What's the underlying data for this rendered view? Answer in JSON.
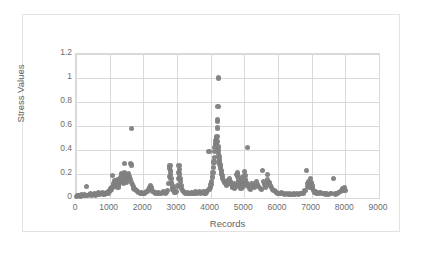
{
  "chart_data": {
    "type": "scatter",
    "title": "",
    "xlabel": "Records",
    "ylabel": "Stress Values",
    "xlim": [
      0,
      9000
    ],
    "ylim": [
      0,
      1.2
    ],
    "xticks": [
      "0",
      "1000",
      "2000",
      "3000",
      "4000",
      "5000",
      "6000",
      "7000",
      "8000",
      "9000"
    ],
    "yticks": [
      "0",
      "0.2",
      "0.4",
      "0.6",
      "0.8",
      "1",
      "1.2"
    ],
    "xtick_values": [
      0,
      1000,
      2000,
      3000,
      4000,
      5000,
      6000,
      7000,
      8000,
      9000
    ],
    "ytick_values": [
      0,
      0.2,
      0.4,
      0.6,
      0.8,
      1,
      1.2
    ],
    "grid": true,
    "legend": false,
    "marker_color": "#7f7f7f",
    "marker_size": 2.6,
    "gridline_color": "#d9d9d9",
    "series": [
      {
        "name": "Stress Values",
        "points": [
          [
            20,
            0.012
          ],
          [
            55,
            0.018
          ],
          [
            90,
            0.022
          ],
          [
            130,
            0.015
          ],
          [
            170,
            0.028
          ],
          [
            210,
            0.02
          ],
          [
            250,
            0.031
          ],
          [
            290,
            0.024
          ],
          [
            320,
            0.095
          ],
          [
            350,
            0.018
          ],
          [
            390,
            0.026
          ],
          [
            430,
            0.034
          ],
          [
            470,
            0.021
          ],
          [
            510,
            0.029
          ],
          [
            550,
            0.038
          ],
          [
            590,
            0.025
          ],
          [
            630,
            0.033
          ],
          [
            670,
            0.041
          ],
          [
            710,
            0.027
          ],
          [
            750,
            0.036
          ],
          [
            790,
            0.044
          ],
          [
            830,
            0.03
          ],
          [
            870,
            0.039
          ],
          [
            910,
            0.048
          ],
          [
            950,
            0.035
          ],
          [
            980,
            0.052
          ],
          [
            1010,
            0.062
          ],
          [
            1040,
            0.075
          ],
          [
            1070,
            0.088
          ],
          [
            1090,
            0.185
          ],
          [
            1110,
            0.105
          ],
          [
            1130,
            0.12
          ],
          [
            1150,
            0.142
          ],
          [
            1170,
            0.098
          ],
          [
            1190,
            0.115
          ],
          [
            1210,
            0.133
          ],
          [
            1230,
            0.155
          ],
          [
            1250,
            0.09
          ],
          [
            1270,
            0.108
          ],
          [
            1290,
            0.126
          ],
          [
            1310,
            0.148
          ],
          [
            1330,
            0.17
          ],
          [
            1350,
            0.192
          ],
          [
            1360,
            0.205
          ],
          [
            1370,
            0.16
          ],
          [
            1380,
            0.138
          ],
          [
            1400,
            0.118
          ],
          [
            1420,
            0.2
          ],
          [
            1440,
            0.215
          ],
          [
            1450,
            0.285
          ],
          [
            1460,
            0.18
          ],
          [
            1470,
            0.155
          ],
          [
            1490,
            0.132
          ],
          [
            1510,
            0.148
          ],
          [
            1530,
            0.168
          ],
          [
            1550,
            0.19
          ],
          [
            1570,
            0.205
          ],
          [
            1590,
            0.175
          ],
          [
            1610,
            0.152
          ],
          [
            1630,
            0.285
          ],
          [
            1640,
            0.275
          ],
          [
            1650,
            0.578
          ],
          [
            1660,
            0.13
          ],
          [
            1680,
            0.11
          ],
          [
            1700,
            0.095
          ],
          [
            1720,
            0.082
          ],
          [
            1750,
            0.07
          ],
          [
            1790,
            0.06
          ],
          [
            1830,
            0.052
          ],
          [
            1870,
            0.045
          ],
          [
            1910,
            0.038
          ],
          [
            1950,
            0.042
          ],
          [
            1990,
            0.035
          ],
          [
            2030,
            0.04
          ],
          [
            2070,
            0.048
          ],
          [
            2110,
            0.055
          ],
          [
            2150,
            0.07
          ],
          [
            2190,
            0.09
          ],
          [
            2210,
            0.105
          ],
          [
            2230,
            0.085
          ],
          [
            2250,
            0.068
          ],
          [
            2290,
            0.055
          ],
          [
            2330,
            0.048
          ],
          [
            2370,
            0.042
          ],
          [
            2410,
            0.038
          ],
          [
            2450,
            0.044
          ],
          [
            2490,
            0.036
          ],
          [
            2530,
            0.04
          ],
          [
            2570,
            0.046
          ],
          [
            2610,
            0.052
          ],
          [
            2650,
            0.038
          ],
          [
            2690,
            0.045
          ],
          [
            2730,
            0.06
          ],
          [
            2750,
            0.12
          ],
          [
            2770,
            0.18
          ],
          [
            2780,
            0.25
          ],
          [
            2790,
            0.268
          ],
          [
            2800,
            0.225
          ],
          [
            2810,
            0.195
          ],
          [
            2820,
            0.16
          ],
          [
            2840,
            0.13
          ],
          [
            2860,
            0.1
          ],
          [
            2880,
            0.075
          ],
          [
            2900,
            0.06
          ],
          [
            2920,
            0.05
          ],
          [
            2950,
            0.045
          ],
          [
            2990,
            0.055
          ],
          [
            3020,
            0.1
          ],
          [
            3040,
            0.16
          ],
          [
            3050,
            0.21
          ],
          [
            3060,
            0.272
          ],
          [
            3070,
            0.24
          ],
          [
            3080,
            0.2
          ],
          [
            3090,
            0.165
          ],
          [
            3100,
            0.135
          ],
          [
            3120,
            0.105
          ],
          [
            3140,
            0.082
          ],
          [
            3160,
            0.065
          ],
          [
            3190,
            0.052
          ],
          [
            3230,
            0.045
          ],
          [
            3270,
            0.038
          ],
          [
            3310,
            0.042
          ],
          [
            3350,
            0.035
          ],
          [
            3390,
            0.04
          ],
          [
            3430,
            0.046
          ],
          [
            3470,
            0.036
          ],
          [
            3510,
            0.042
          ],
          [
            3550,
            0.05
          ],
          [
            3590,
            0.038
          ],
          [
            3630,
            0.044
          ],
          [
            3670,
            0.052
          ],
          [
            3710,
            0.04
          ],
          [
            3750,
            0.046
          ],
          [
            3790,
            0.055
          ],
          [
            3830,
            0.042
          ],
          [
            3870,
            0.05
          ],
          [
            3910,
            0.062
          ],
          [
            3950,
            0.388
          ],
          [
            3970,
            0.075
          ],
          [
            3990,
            0.09
          ],
          [
            4010,
            0.11
          ],
          [
            4030,
            0.14
          ],
          [
            4050,
            0.175
          ],
          [
            4070,
            0.215
          ],
          [
            4090,
            0.255
          ],
          [
            4100,
            0.3
          ],
          [
            4110,
            0.34
          ],
          [
            4120,
            0.39
          ],
          [
            4130,
            0.42
          ],
          [
            4140,
            0.455
          ],
          [
            4150,
            0.48
          ],
          [
            4160,
            0.445
          ],
          [
            4170,
            0.5
          ],
          [
            4180,
            0.46
          ],
          [
            4190,
            0.515
          ],
          [
            4200,
            0.47
          ],
          [
            4205,
            0.583
          ],
          [
            4210,
            0.64
          ],
          [
            4215,
            0.655
          ],
          [
            4220,
            0.76
          ],
          [
            4225,
            1.0
          ],
          [
            4230,
            0.425
          ],
          [
            4235,
            0.398
          ],
          [
            4240,
            0.37
          ],
          [
            4250,
            0.345
          ],
          [
            4260,
            0.32
          ],
          [
            4270,
            0.3
          ],
          [
            4280,
            0.28
          ],
          [
            4290,
            0.262
          ],
          [
            4300,
            0.245
          ],
          [
            4310,
            0.228
          ],
          [
            4320,
            0.212
          ],
          [
            4330,
            0.198
          ],
          [
            4340,
            0.185
          ],
          [
            4350,
            0.172
          ],
          [
            4360,
            0.16
          ],
          [
            4380,
            0.148
          ],
          [
            4400,
            0.138
          ],
          [
            4420,
            0.128
          ],
          [
            4440,
            0.118
          ],
          [
            4460,
            0.11
          ],
          [
            4480,
            0.102
          ],
          [
            4500,
            0.145
          ],
          [
            4520,
            0.13
          ],
          [
            4540,
            0.118
          ],
          [
            4560,
            0.16
          ],
          [
            4580,
            0.14
          ],
          [
            4600,
            0.125
          ],
          [
            4620,
            0.112
          ],
          [
            4640,
            0.1
          ],
          [
            4660,
            0.092
          ],
          [
            4680,
            0.085
          ],
          [
            4700,
            0.078
          ],
          [
            4720,
            0.12
          ],
          [
            4740,
            0.105
          ],
          [
            4760,
            0.095
          ],
          [
            4780,
            0.195
          ],
          [
            4790,
            0.215
          ],
          [
            4800,
            0.18
          ],
          [
            4820,
            0.15
          ],
          [
            4840,
            0.128
          ],
          [
            4860,
            0.11
          ],
          [
            4880,
            0.095
          ],
          [
            4900,
            0.082
          ],
          [
            4920,
            0.17
          ],
          [
            4940,
            0.14
          ],
          [
            4960,
            0.118
          ],
          [
            4980,
            0.1
          ],
          [
            5000,
            0.218
          ],
          [
            5020,
            0.185
          ],
          [
            5040,
            0.155
          ],
          [
            5060,
            0.13
          ],
          [
            5080,
            0.11
          ],
          [
            5100,
            0.42
          ],
          [
            5120,
            0.095
          ],
          [
            5150,
            0.082
          ],
          [
            5190,
            0.072
          ],
          [
            5230,
            0.12
          ],
          [
            5270,
            0.1
          ],
          [
            5310,
            0.085
          ],
          [
            5350,
            0.14
          ],
          [
            5390,
            0.115
          ],
          [
            5430,
            0.095
          ],
          [
            5470,
            0.08
          ],
          [
            5510,
            0.068
          ],
          [
            5550,
            0.228
          ],
          [
            5570,
            0.135
          ],
          [
            5600,
            0.11
          ],
          [
            5640,
            0.09
          ],
          [
            5680,
            0.195
          ],
          [
            5700,
            0.15
          ],
          [
            5720,
            0.125
          ],
          [
            5740,
            0.13
          ],
          [
            5760,
            0.105
          ],
          [
            5800,
            0.085
          ],
          [
            5840,
            0.07
          ],
          [
            5880,
            0.06
          ],
          [
            5920,
            0.052
          ],
          [
            5960,
            0.045
          ],
          [
            6000,
            0.04
          ],
          [
            6050,
            0.035
          ],
          [
            6100,
            0.042
          ],
          [
            6150,
            0.038
          ],
          [
            6200,
            0.032
          ],
          [
            6250,
            0.036
          ],
          [
            6300,
            0.03
          ],
          [
            6350,
            0.034
          ],
          [
            6400,
            0.028
          ],
          [
            6450,
            0.033
          ],
          [
            6500,
            0.03
          ],
          [
            6550,
            0.036
          ],
          [
            6600,
            0.032
          ],
          [
            6650,
            0.038
          ],
          [
            6700,
            0.035
          ],
          [
            6750,
            0.042
          ],
          [
            6800,
            0.06
          ],
          [
            6850,
            0.228
          ],
          [
            6870,
            0.12
          ],
          [
            6890,
            0.095
          ],
          [
            6910,
            0.14
          ],
          [
            6930,
            0.11
          ],
          [
            6950,
            0.085
          ],
          [
            6970,
            0.165
          ],
          [
            6990,
            0.13
          ],
          [
            7010,
            0.1
          ],
          [
            7030,
            0.078
          ],
          [
            7060,
            0.062
          ],
          [
            7100,
            0.05
          ],
          [
            7150,
            0.042
          ],
          [
            7200,
            0.038
          ],
          [
            7250,
            0.044
          ],
          [
            7300,
            0.036
          ],
          [
            7350,
            0.04
          ],
          [
            7400,
            0.034
          ],
          [
            7450,
            0.038
          ],
          [
            7500,
            0.032
          ],
          [
            7550,
            0.036
          ],
          [
            7600,
            0.04
          ],
          [
            7650,
            0.162
          ],
          [
            7700,
            0.034
          ],
          [
            7750,
            0.038
          ],
          [
            7800,
            0.045
          ],
          [
            7850,
            0.052
          ],
          [
            7900,
            0.06
          ],
          [
            7930,
            0.075
          ],
          [
            7950,
            0.07
          ],
          [
            7970,
            0.085
          ],
          [
            7990,
            0.065
          ]
        ]
      }
    ]
  }
}
